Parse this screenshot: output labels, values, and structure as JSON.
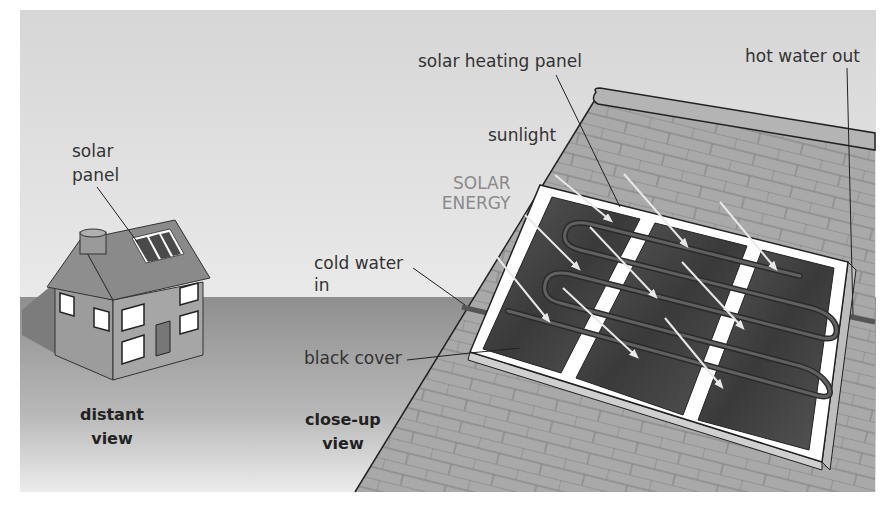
{
  "diagram": {
    "colors": {
      "sky_top": "#d9d9d9",
      "sky_bottom": "#f4f4f4",
      "ground": "#9a9a9a",
      "roof_tile": "#a8a8a8",
      "panel_frame": "#ffffff",
      "panel_cell": "#4a4a4a",
      "arrow": "#e6e6e6",
      "leader_line": "#222222"
    },
    "labels": {
      "solar_panel_line1": "solar",
      "solar_panel_line2": "panel",
      "solar_heating_panel": "solar heating panel",
      "hot_water_out": "hot water out",
      "sunlight": "sunlight",
      "solar_energy_line1": "SOLAR",
      "solar_energy_line2": "ENERGY",
      "cold_water_in_line1": "cold water",
      "cold_water_in_line2": "in",
      "black_cover": "black cover",
      "distant_view_line1": "distant",
      "distant_view_line2": "view",
      "closeup_view_line1": "close-up",
      "closeup_view_line2": "view"
    },
    "views": [
      {
        "name": "distant view",
        "subject": "house with rooftop solar panel"
      },
      {
        "name": "close-up view",
        "subject": "solar heating panel on roof tiles with three sections, serpentine pipe, sunlight arrows"
      }
    ]
  }
}
